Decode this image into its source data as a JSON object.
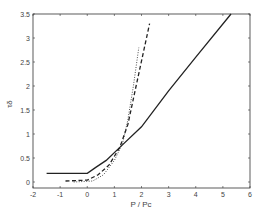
{
  "chart_data": {
    "type": "line",
    "title": "",
    "xlabel": "P / Pc",
    "ylabel": "τδ",
    "xlim": [
      -2,
      6
    ],
    "ylim": [
      -0.1,
      3.5
    ],
    "xticks": [
      "-2",
      "-1",
      "0",
      "1",
      "2",
      "3",
      "4",
      "5",
      "6"
    ],
    "yticks": [
      "0",
      "0.5",
      "1",
      "1.5",
      "2",
      "2.5",
      "3",
      "3.5"
    ],
    "grid": false,
    "legend": null,
    "series": [
      {
        "name": "solid",
        "style": "solid",
        "x": [
          -1.5,
          0.0,
          0.3,
          0.7,
          1.2,
          2.0,
          3.0,
          4.0,
          5.3
        ],
        "y": [
          0.18,
          0.18,
          0.3,
          0.45,
          0.72,
          1.15,
          1.9,
          2.6,
          3.5
        ]
      },
      {
        "name": "dashed",
        "style": "dashed",
        "x": [
          -0.8,
          0.0,
          0.4,
          0.8,
          1.2,
          1.5,
          1.8,
          2.3
        ],
        "y": [
          0.02,
          0.04,
          0.15,
          0.35,
          0.72,
          1.2,
          2.0,
          3.3
        ]
      },
      {
        "name": "dotted",
        "style": "dotted",
        "x": [
          -0.5,
          0.2,
          0.6,
          1.0,
          1.3,
          1.5,
          1.7,
          1.9
        ],
        "y": [
          0.0,
          0.02,
          0.15,
          0.45,
          0.8,
          1.3,
          2.0,
          2.8
        ]
      }
    ]
  }
}
